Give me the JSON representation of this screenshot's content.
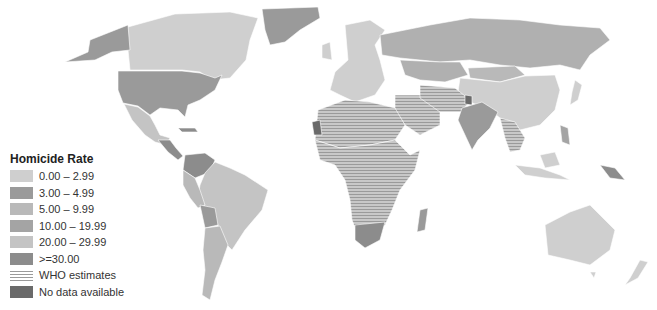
{
  "legend": {
    "title": "Homicide Rate",
    "items": [
      {
        "label": "0.00 – 2.99",
        "color": "#cfcfcf",
        "pattern": "solid"
      },
      {
        "label": "3.00 – 4.99",
        "color": "#9a9a9a",
        "pattern": "solid"
      },
      {
        "label": "5.00 – 9.99",
        "color": "#b9b9b9",
        "pattern": "solid"
      },
      {
        "label": "10.00 – 19.99",
        "color": "#a4a4a4",
        "pattern": "solid"
      },
      {
        "label": "20.00 – 29.99",
        "color": "#c4c4c4",
        "pattern": "solid"
      },
      {
        "label": ">=30.00",
        "color": "#8c8c8c",
        "pattern": "solid"
      },
      {
        "label": "WHO estimates",
        "color": "#9a9a9a",
        "pattern": "hatch"
      },
      {
        "label": "No data available",
        "color": "#6a6a6a",
        "pattern": "solid"
      }
    ]
  },
  "regions": {
    "greenland": "#9a9a9a",
    "canada": "#cfcfcf",
    "alaska": "#9a9a9a",
    "usa": "#9a9a9a",
    "mexico": "#c4c4c4",
    "central_america": "#8c8c8c",
    "venezuela": "#8c8c8c",
    "brazil": "#c4c4c4",
    "south_america_west": "#b9b9b9",
    "argentina": "#b9b9b9",
    "bolivia": "#9a9a9a",
    "europe": "#cfcfcf",
    "russia": "#b0b0b0",
    "kazakhstan": "#b0b0b0",
    "china": "#cfcfcf",
    "india": "#9a9a9a",
    "middle_east": "#b9b9b9",
    "iran_pakistan": "#9a9a9a",
    "north_africa": "#cfcfcf",
    "sub_saharan_africa": "#a4a4a4",
    "south_africa": "#8c8c8c",
    "madagascar": "#9a9a9a",
    "se_asia": "#a4a4a4",
    "indonesia": "#cfcfcf",
    "papua_new_guinea": "#8c8c8c",
    "australia": "#cfcfcf",
    "new_zealand": "#cfcfcf",
    "japan": "#cfcfcf",
    "mongolia": "#b9b9b9",
    "no_data": "#6a6a6a",
    "border": "#ffffff"
  }
}
